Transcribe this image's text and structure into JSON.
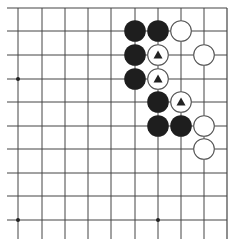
{
  "board": {
    "description": "Go board corner section (top-right), 10 columns x 10 rows visible",
    "background": "#ffffff",
    "line_color": "#444444",
    "x_lines": [
      18,
      42,
      65,
      88,
      111,
      135,
      158,
      181,
      204,
      227
    ],
    "y_lines": [
      8,
      31,
      55,
      79,
      102,
      126,
      149,
      173,
      196,
      220
    ],
    "top_edge": true,
    "right_edge": true,
    "star_points": [
      {
        "col": 0,
        "row": 3
      },
      {
        "col": 0,
        "row": 9
      },
      {
        "col": 6,
        "row": 9
      }
    ],
    "stones": [
      {
        "col": 5,
        "row": 1,
        "color": "black",
        "marker": null
      },
      {
        "col": 6,
        "row": 1,
        "color": "black",
        "marker": null
      },
      {
        "col": 7,
        "row": 1,
        "color": "white",
        "marker": null
      },
      {
        "col": 5,
        "row": 2,
        "color": "black",
        "marker": null
      },
      {
        "col": 6,
        "row": 2,
        "color": "white",
        "marker": "triangle"
      },
      {
        "col": 8,
        "row": 2,
        "color": "white",
        "marker": null
      },
      {
        "col": 5,
        "row": 3,
        "color": "black",
        "marker": null
      },
      {
        "col": 6,
        "row": 3,
        "color": "white",
        "marker": "triangle"
      },
      {
        "col": 6,
        "row": 4,
        "color": "black",
        "marker": null
      },
      {
        "col": 7,
        "row": 4,
        "color": "white",
        "marker": "triangle"
      },
      {
        "col": 6,
        "row": 5,
        "color": "black",
        "marker": null
      },
      {
        "col": 7,
        "row": 5,
        "color": "black",
        "marker": null
      },
      {
        "col": 8,
        "row": 5,
        "color": "white",
        "marker": null
      },
      {
        "col": 8,
        "row": 6,
        "color": "white",
        "marker": null
      }
    ],
    "colors": {
      "black_stone": "#1e1e1e",
      "white_stone": "#ffffff",
      "white_stroke": "#555555",
      "marker": "#222222"
    }
  }
}
